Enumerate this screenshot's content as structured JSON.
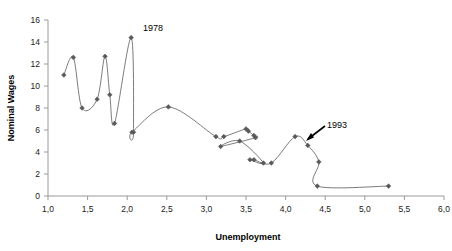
{
  "chart_data": {
    "type": "scatter",
    "title": "",
    "xlabel": "Unemployment",
    "ylabel": "Nominal Wages",
    "xlim": [
      1.0,
      6.0
    ],
    "ylim": [
      0,
      16
    ],
    "grid": false,
    "legend": "none",
    "connected": true,
    "xticks": [
      "1,0",
      "1,5",
      "2,0",
      "2,5",
      "3,0",
      "3,5",
      "4,0",
      "4,5",
      "5,0",
      "5,5",
      "6,0"
    ],
    "xtick_values": [
      1.0,
      1.5,
      2.0,
      2.5,
      3.0,
      3.5,
      4.0,
      4.5,
      5.0,
      5.5,
      6.0
    ],
    "yticks": [
      "0",
      "2",
      "4",
      "6",
      "8",
      "10",
      "12",
      "14",
      "16"
    ],
    "ytick_values": [
      0,
      2,
      4,
      6,
      8,
      10,
      12,
      14,
      16
    ],
    "series_name": "Phillips curve path",
    "series_color": "#595959",
    "marker": "diamond",
    "x": [
      1.2,
      1.32,
      1.43,
      1.62,
      1.72,
      1.78,
      1.84,
      2.05,
      2.08,
      2.06,
      2.52,
      3.12,
      3.22,
      3.5,
      3.53,
      3.6,
      3.62,
      3.18,
      3.42,
      3.72,
      3.55,
      3.6,
      3.82,
      4.12,
      4.28,
      4.42,
      4.4,
      5.3
    ],
    "y": [
      11.0,
      12.6,
      8.0,
      8.8,
      12.7,
      9.2,
      6.6,
      14.4,
      5.8,
      5.8,
      8.1,
      5.4,
      5.4,
      6.1,
      5.9,
      5.5,
      5.3,
      4.5,
      5.0,
      3.0,
      3.3,
      3.3,
      3.0,
      5.4,
      4.6,
      3.1,
      0.9,
      0.9
    ],
    "annotations": [
      {
        "label": "1978",
        "x": 2.05,
        "y": 14.4,
        "type": "text"
      },
      {
        "label": "1993",
        "x": 4.28,
        "y": 4.6,
        "type": "arrow-text"
      }
    ]
  },
  "axis": {
    "y_title": "Nominal Wages",
    "x_title": "Unemployment"
  },
  "annotations": {
    "year_start": "1978",
    "year_end": "1993"
  }
}
